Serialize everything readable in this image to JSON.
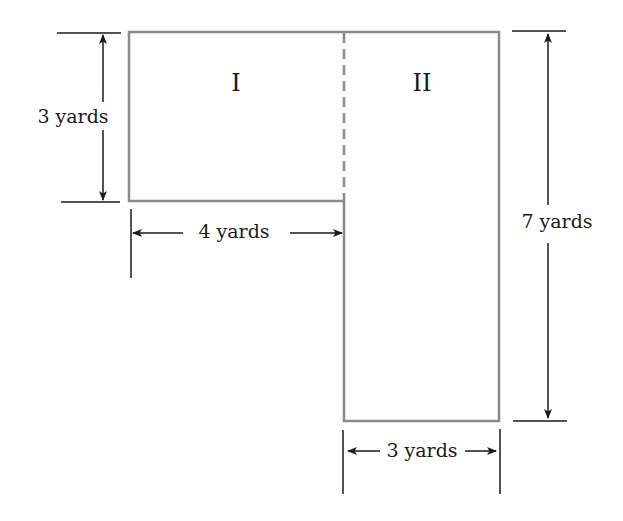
{
  "diagram": {
    "type": "composite-area-figure",
    "colors": {
      "outline": "#8a8a8a",
      "dimension_lines": "#1a1a1a",
      "text": "#1a1a1a",
      "background": "#ffffff"
    },
    "regions": [
      {
        "id": "I",
        "label": "I",
        "width_yards": 4,
        "height_yards": 3
      },
      {
        "id": "II",
        "label": "II",
        "width_yards": 3,
        "height_yards": 7
      }
    ],
    "dimensions": {
      "left_height": "3 yards",
      "bottom_width_region1": "4 yards",
      "right_height": "7 yards",
      "bottom_width_region2": "3 yards"
    }
  }
}
